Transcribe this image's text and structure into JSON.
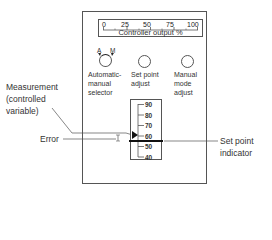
{
  "gauge": {
    "ticks": [
      "0",
      "25",
      "50",
      "75",
      "100"
    ],
    "title": "Controller output %"
  },
  "knobs": [
    {
      "id": "auto-manual-selector",
      "label_lines": [
        "Automatic-",
        "manual",
        "selector"
      ],
      "markers": [
        "A",
        "M"
      ]
    },
    {
      "id": "set-point-adjust",
      "label_lines": [
        "Set point",
        "adjust"
      ]
    },
    {
      "id": "manual-mode-adjust",
      "label_lines": [
        "Manual",
        "mode",
        "adjust"
      ]
    }
  ],
  "scale": {
    "ticks": [
      "90",
      "80",
      "70",
      "60",
      "50",
      "40"
    ],
    "measurement_value": 62,
    "set_point_value": 55
  },
  "callouts": {
    "measurement": [
      "Measurement",
      "(controlled",
      "variable)"
    ],
    "error": "Error",
    "set_point_indicator": [
      "Set point",
      "indicator"
    ]
  },
  "colors": {
    "line": "#555555",
    "text": "#333333",
    "background": "#ffffff"
  }
}
